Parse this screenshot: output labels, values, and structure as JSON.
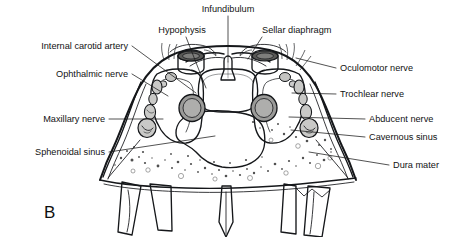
{
  "figure": {
    "panel_letter": "B",
    "background_color": "#ffffff",
    "ink_color": "#15171a",
    "label_color": "#121212"
  },
  "palette": {
    "bone_pale": "#e2e2e0",
    "bone_stipple": "#dcdcda",
    "sinus_lumen": "#b9b9b7",
    "cavernous_sinus": "#8c8c8a",
    "cavernous_sinus_dark": "#7a7a78",
    "sellar_cylinder": "#6b6b69",
    "pituitary": "#b5b5b3",
    "carotid_lumen": "#9a9a98",
    "nerve_oval": "#c9c9c7",
    "pterygoid": "#d4d4d2"
  },
  "labels": {
    "left": [
      {
        "id": "internal-carotid-artery",
        "text": "Internal carotid artery",
        "tx": 128,
        "ty": 49,
        "lx": 132,
        "ly": 46,
        "px": 196,
        "py": 93
      },
      {
        "id": "ophthalmic-nerve",
        "text": "Ophthalmic nerve",
        "tx": 128,
        "ty": 77,
        "lx": 132,
        "ly": 74,
        "px": 168,
        "py": 96
      },
      {
        "id": "maxillary-nerve",
        "text": "Maxillary nerve",
        "tx": 105,
        "ty": 122,
        "lx": 109,
        "ly": 119,
        "px": 163,
        "py": 119
      },
      {
        "id": "sphenoidal-sinus",
        "text": "Sphenoidal sinus",
        "tx": 105,
        "ty": 155,
        "lx": 109,
        "ly": 152,
        "px": 215,
        "py": 136
      }
    ],
    "right": [
      {
        "id": "oculomotor-nerve",
        "text": "Oculomotor nerve",
        "tx": 340,
        "ty": 71,
        "lx": 336,
        "ly": 68,
        "px": 296,
        "py": 58
      },
      {
        "id": "trochlear-nerve",
        "text": "Trochlear nerve",
        "tx": 340,
        "ty": 97,
        "lx": 336,
        "ly": 94,
        "px": 292,
        "py": 93
      },
      {
        "id": "abducent-nerve",
        "text": "Abducent nerve",
        "tx": 369,
        "ty": 122,
        "lx": 365,
        "ly": 119,
        "px": 289,
        "py": 117
      },
      {
        "id": "cavernous-sinus",
        "text": "Cavernous sinus",
        "tx": 369,
        "ty": 140,
        "lx": 365,
        "ly": 137,
        "px": 291,
        "py": 130
      },
      {
        "id": "dura-mater",
        "text": "Dura mater",
        "tx": 393,
        "ty": 168,
        "lx": 389,
        "ly": 165,
        "px": 309,
        "py": 152
      }
    ],
    "top": [
      {
        "id": "infundibulum",
        "text": "Infundibulum",
        "tx": 228,
        "ty": 12,
        "lx": 228,
        "ly": 16,
        "px": 228,
        "py": 62
      },
      {
        "id": "hypophysis",
        "text": "Hypophysis",
        "tx": 182,
        "ty": 33,
        "lx": 186,
        "ly": 37,
        "px": 206,
        "py": 88
      },
      {
        "id": "sellar-diaphragm",
        "text": "Sellar diaphragm",
        "tx": 262,
        "ty": 33,
        "lx": 262,
        "ly": 37,
        "px": 248,
        "py": 59
      }
    ]
  }
}
